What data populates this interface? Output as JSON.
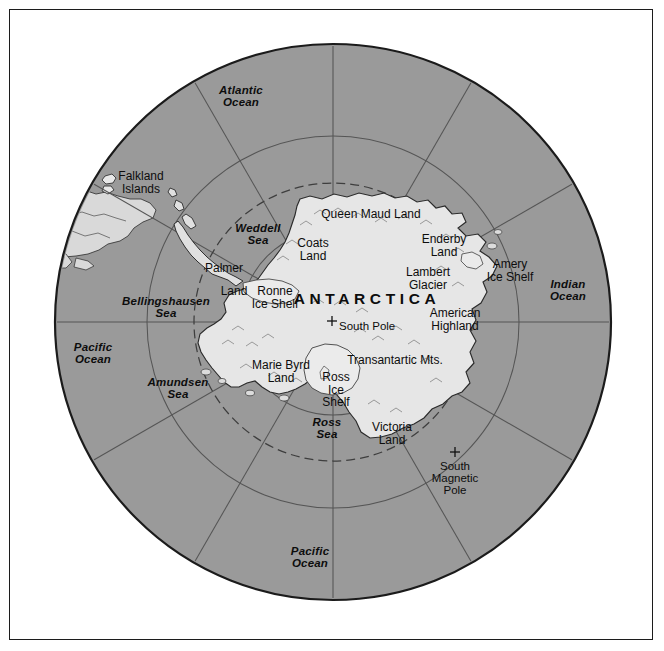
{
  "figure": {
    "background_color": "#ffffff",
    "frame_color": "#1c1c1c",
    "ocean_color": "#9a9a9a",
    "ice_color": "#e3e3e3",
    "graticule_color": "#545454",
    "coastline_color": "#2b2b2b"
  },
  "projection": {
    "type": "south-polar-azimuthal",
    "center_x": 333,
    "center_y": 322,
    "radius": 278,
    "meridian_count": 12,
    "parallel_count": 3
  },
  "labels": {
    "continent": [
      {
        "name": "antarctica-label",
        "text": "ANTARCTICA",
        "x": 367,
        "y": 291,
        "class": "continent ctr"
      }
    ],
    "oceans": [
      {
        "name": "atlantic-ocean-label",
        "text": "Atlantic\nOcean",
        "x": 241,
        "y": 84,
        "class": "ocean ctr"
      },
      {
        "name": "indian-ocean-label",
        "text": "Indian\nOcean",
        "x": 568,
        "y": 278,
        "class": "ocean ctr"
      },
      {
        "name": "pacific-ocean-west-label",
        "text": "Pacific\nOcean",
        "x": 93,
        "y": 341,
        "class": "ocean ctr"
      },
      {
        "name": "pacific-ocean-south-label",
        "text": "Pacific\nOcean",
        "x": 310,
        "y": 545,
        "class": "ocean ctr"
      }
    ],
    "seas": [
      {
        "name": "weddell-sea-label",
        "text": "Weddell\nSea",
        "x": 258,
        "y": 222,
        "class": "sea ctr"
      },
      {
        "name": "bellingshausen-sea-label",
        "text": "Bellingshausen\nSea",
        "x": 166,
        "y": 295,
        "class": "sea ctr"
      },
      {
        "name": "amundsen-sea-label",
        "text": "Amundsen\nSea",
        "x": 178,
        "y": 376,
        "class": "sea ctr"
      },
      {
        "name": "ross-sea-label",
        "text": "Ross\nSea",
        "x": 327,
        "y": 416,
        "class": "sea ctr"
      }
    ],
    "lands": [
      {
        "name": "queen-maud-land-label",
        "text": "Queen Maud Land",
        "x": 371,
        "y": 208,
        "class": "land ctr"
      },
      {
        "name": "coats-land-label",
        "text": "Coats\nLand",
        "x": 313,
        "y": 237,
        "class": "land ctr"
      },
      {
        "name": "enderby-land-label",
        "text": "Enderby\nLand",
        "x": 444,
        "y": 233,
        "class": "land ctr"
      },
      {
        "name": "lambert-glacier-label",
        "text": "Lambert\nGlacier",
        "x": 428,
        "y": 266,
        "class": "land ctr"
      },
      {
        "name": "amery-ice-shelf-label",
        "text": "Amery\nIce Shelf",
        "x": 510,
        "y": 258,
        "class": "land ctr"
      },
      {
        "name": "american-highland-label",
        "text": "American\nHighland",
        "x": 455,
        "y": 307,
        "class": "land ctr"
      },
      {
        "name": "palmer-land-label",
        "text": "Palmer",
        "x": 224,
        "y": 262,
        "class": "land ctr"
      },
      {
        "name": "palmer-land-second-label",
        "text": "Land",
        "x": 234,
        "y": 285,
        "class": "land ctr"
      },
      {
        "name": "ronne-ice-shelf-label",
        "text": "Ronne\nIce Shelf",
        "x": 275,
        "y": 285,
        "class": "land ctr"
      },
      {
        "name": "marie-byrd-land-label",
        "text": "Marie Byrd\nLand",
        "x": 281,
        "y": 359,
        "class": "land ctr"
      },
      {
        "name": "ross-ice-shelf-label",
        "text": "Ross\nIce\nShelf",
        "x": 336,
        "y": 371,
        "class": "land ctr"
      },
      {
        "name": "transantarctic-mts-label",
        "text": "Transantartic Mts.",
        "x": 395,
        "y": 354,
        "class": "land ctr"
      },
      {
        "name": "victoria-land-label",
        "text": "Victoria\nLand",
        "x": 392,
        "y": 421,
        "class": "land ctr"
      },
      {
        "name": "falkland-islands-label",
        "text": "Falkland\nIslands",
        "x": 141,
        "y": 170,
        "class": "islands ctr"
      }
    ],
    "points": [
      {
        "name": "south-pole-label",
        "text": "South Pole",
        "x": 339,
        "y": 320,
        "class": "poi lft",
        "marker_x": 332,
        "marker_y": 320
      },
      {
        "name": "south-magnetic-pole-label",
        "text": "South\nMagnetic\nPole",
        "x": 455,
        "y": 460,
        "class": "poi ctr",
        "marker_x": 455,
        "marker_y": 450
      }
    ]
  },
  "markers": [
    {
      "name": "south-pole-marker",
      "glyph": "+",
      "x": 332,
      "y": 321
    },
    {
      "name": "south-magnetic-pole-marker",
      "glyph": "+",
      "x": 455,
      "y": 452
    }
  ]
}
